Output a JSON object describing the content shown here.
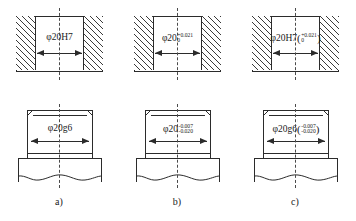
{
  "figure": {
    "panels": [
      {
        "caption": "a)",
        "hole": {
          "view": "sectioned hole",
          "dimension_prefix": "φ20H7",
          "tolerance_upper": "",
          "tolerance_lower": "",
          "has_parentheses": false,
          "notation_style": "symbol-only"
        },
        "shaft": {
          "view": "shaft",
          "dimension_prefix": "φ20g6",
          "tolerance_upper": "",
          "tolerance_lower": "",
          "has_parentheses": false,
          "notation_style": "symbol-only"
        }
      },
      {
        "caption": "b)",
        "hole": {
          "view": "sectioned hole",
          "dimension_prefix": "φ20",
          "tolerance_upper": "+0.021",
          "tolerance_lower": "0",
          "has_parentheses": false,
          "notation_style": "deviations-only"
        },
        "shaft": {
          "view": "shaft",
          "dimension_prefix": "φ20",
          "tolerance_upper": "-0.007",
          "tolerance_lower": "-0.020",
          "has_parentheses": false,
          "notation_style": "deviations-only"
        }
      },
      {
        "caption": "c)",
        "hole": {
          "view": "sectioned hole",
          "dimension_prefix": "φ20H7",
          "tolerance_upper": "+0.021",
          "tolerance_lower": "0",
          "has_parentheses": true,
          "notation_style": "symbol-with-deviations"
        },
        "shaft": {
          "view": "shaft",
          "dimension_prefix": "φ20g6",
          "tolerance_upper": "-0.007",
          "tolerance_lower": "-0.020",
          "has_parentheses": true,
          "notation_style": "symbol-with-deviations"
        }
      }
    ],
    "colors": {
      "line": "#2b2b2b",
      "hatch": "#3a3a3a",
      "centerline": "#4a4a4a",
      "background": "#ffffff",
      "text": "#1a1a1a"
    }
  }
}
